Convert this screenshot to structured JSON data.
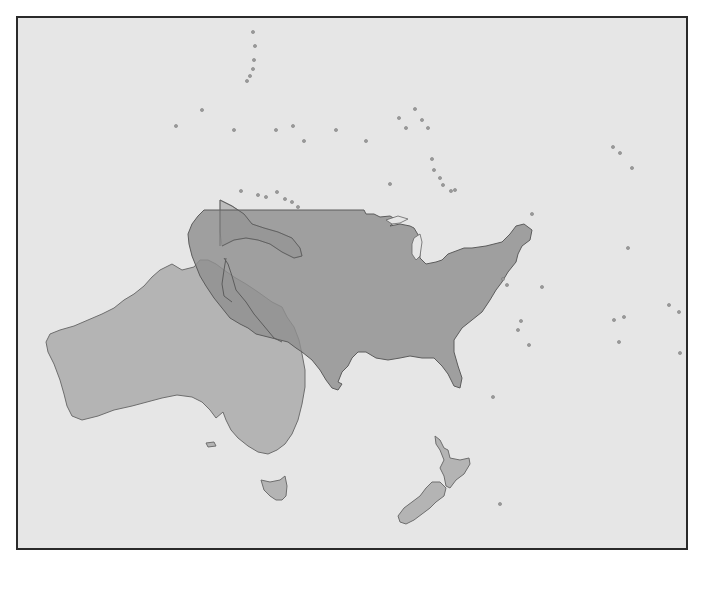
{
  "map": {
    "title": "",
    "description": "Size comparison: contiguous United States overlaid on Australia, with New Zealand and Pacific islands",
    "colors": {
      "ocean": "#e6e6e6",
      "frame": "#2a2a2a",
      "australia": "#b4b4b4",
      "new_zealand": "#b4b4b4",
      "united_states_overlay": "#8f8f8f",
      "islands": "#9a9a9a"
    },
    "regions": [
      {
        "name": "united-states",
        "label": "",
        "type": "overlay"
      },
      {
        "name": "australia",
        "label": "",
        "type": "landmass"
      },
      {
        "name": "tasmania",
        "label": "",
        "type": "landmass"
      },
      {
        "name": "new-zealand",
        "label": "",
        "type": "landmass"
      },
      {
        "name": "new-guinea",
        "label": "",
        "type": "landmass"
      }
    ],
    "islands": [
      [
        251,
        30
      ],
      [
        253,
        44
      ],
      [
        252,
        58
      ],
      [
        251,
        67
      ],
      [
        248,
        74
      ],
      [
        245,
        79
      ],
      [
        200,
        108
      ],
      [
        174,
        124
      ],
      [
        232,
        128
      ],
      [
        274,
        128
      ],
      [
        291,
        124
      ],
      [
        302,
        139
      ],
      [
        334,
        128
      ],
      [
        364,
        139
      ],
      [
        397,
        116
      ],
      [
        404,
        126
      ],
      [
        413,
        107
      ],
      [
        420,
        118
      ],
      [
        426,
        126
      ],
      [
        430,
        157
      ],
      [
        432,
        168
      ],
      [
        438,
        176
      ],
      [
        441,
        183
      ],
      [
        449,
        189
      ],
      [
        453,
        188
      ],
      [
        388,
        182
      ],
      [
        530,
        212
      ],
      [
        611,
        145
      ],
      [
        618,
        151
      ],
      [
        630,
        166
      ],
      [
        626,
        246
      ],
      [
        239,
        189
      ],
      [
        256,
        193
      ],
      [
        264,
        195
      ],
      [
        275,
        190
      ],
      [
        283,
        197
      ],
      [
        290,
        200
      ],
      [
        296,
        205
      ],
      [
        501,
        277
      ],
      [
        505,
        283
      ],
      [
        540,
        285
      ],
      [
        519,
        319
      ],
      [
        516,
        328
      ],
      [
        527,
        343
      ],
      [
        612,
        318
      ],
      [
        617,
        340
      ],
      [
        622,
        315
      ],
      [
        667,
        303
      ],
      [
        677,
        310
      ],
      [
        678,
        351
      ],
      [
        491,
        395
      ],
      [
        498,
        502
      ],
      [
        396,
        551
      ]
    ]
  }
}
